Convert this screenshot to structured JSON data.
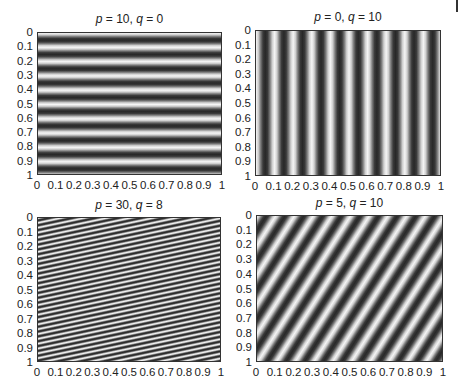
{
  "chart_data": [
    {
      "type": "heatmap",
      "title": "p = 10, q = 0",
      "p": 10,
      "q": 0,
      "function": "cos(2π(p·y + q·x))",
      "xlabel": "",
      "ylabel": "",
      "xlim": [
        0,
        1
      ],
      "ylim": [
        1,
        0
      ],
      "xticks": [
        "0",
        "0.1",
        "0.2",
        "0.3",
        "0.4",
        "0.5",
        "0.6",
        "0.7",
        "0.8",
        "0.9",
        "1"
      ],
      "yticks": [
        "0",
        "0.1",
        "0.2",
        "0.3",
        "0.4",
        "0.5",
        "0.6",
        "0.7",
        "0.8",
        "0.9",
        "1"
      ],
      "colormap": "gray",
      "description": "10 horizontal stripes"
    },
    {
      "type": "heatmap",
      "title": "p = 0, q = 10",
      "p": 0,
      "q": 10,
      "function": "cos(2π(p·y + q·x))",
      "xlabel": "",
      "ylabel": "",
      "xlim": [
        0,
        1
      ],
      "ylim": [
        1,
        0
      ],
      "xticks": [
        "0",
        "0.1",
        "0.2",
        "0.3",
        "0.4",
        "0.5",
        "0.6",
        "0.7",
        "0.8",
        "0.9",
        "1"
      ],
      "yticks": [
        "0",
        "0.1",
        "0.2",
        "0.3",
        "0.4",
        "0.5",
        "0.6",
        "0.7",
        "0.8",
        "0.9",
        "1"
      ],
      "colormap": "gray",
      "description": "10 vertical stripes"
    },
    {
      "type": "heatmap",
      "title": "p = 30, q = 8",
      "p": 30,
      "q": 8,
      "function": "cos(2π(p·y + q·x))",
      "xlabel": "",
      "ylabel": "",
      "xlim": [
        0,
        1
      ],
      "ylim": [
        1,
        0
      ],
      "xticks": [
        "0",
        "0.1",
        "0.2",
        "0.3",
        "0.4",
        "0.5",
        "0.6",
        "0.7",
        "0.8",
        "0.9",
        "1"
      ],
      "yticks": [
        "0",
        "0.1",
        "0.2",
        "0.3",
        "0.4",
        "0.5",
        "0.6",
        "0.7",
        "0.8",
        "0.9",
        "1"
      ],
      "colormap": "gray",
      "description": "dense shallow diagonal stripes"
    },
    {
      "type": "heatmap",
      "title": "p = 5, q = 10",
      "p": 5,
      "q": 10,
      "function": "cos(2π(p·y + q·x))",
      "xlabel": "",
      "ylabel": "",
      "xlim": [
        0,
        1
      ],
      "ylim": [
        1,
        0
      ],
      "xticks": [
        "0",
        "0.1",
        "0.2",
        "0.3",
        "0.4",
        "0.5",
        "0.6",
        "0.7",
        "0.8",
        "0.9",
        "1"
      ],
      "yticks": [
        "0",
        "0.1",
        "0.2",
        "0.3",
        "0.4",
        "0.5",
        "0.6",
        "0.7",
        "0.8",
        "0.9",
        "1"
      ],
      "colormap": "gray",
      "description": "steep diagonal stripes"
    }
  ],
  "panels": [
    {
      "p_label": "p",
      "p_val": "10",
      "q_label": "q",
      "q_val": "0"
    },
    {
      "p_label": "p",
      "p_val": "0",
      "q_label": "q",
      "q_val": "10"
    },
    {
      "p_label": "p",
      "p_val": "30",
      "q_label": "q",
      "q_val": "8"
    },
    {
      "p_label": "p",
      "p_val": "5",
      "q_label": "q",
      "q_val": "10"
    }
  ],
  "ticks": [
    "0",
    "0.1",
    "0.2",
    "0.3",
    "0.4",
    "0.5",
    "0.6",
    "0.7",
    "0.8",
    "0.9",
    "1"
  ],
  "colors": {
    "dark": "#2a2a2a",
    "light": "#f2f2f2",
    "axis": "#333333"
  }
}
